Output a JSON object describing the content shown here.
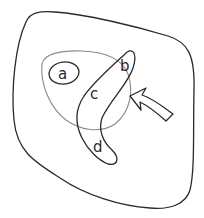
{
  "diagram": {
    "type": "venn-diagram",
    "universe": {
      "name": "universal-set-outline"
    },
    "sets": [
      {
        "name": "large-circle",
        "color": "#8a8a8a"
      },
      {
        "name": "set-a",
        "label": "a",
        "color": "#2a2a2a"
      },
      {
        "name": "boomerang-set",
        "color": "#2a2a2a"
      }
    ],
    "region_labels": {
      "a": "a",
      "b": "b",
      "c": "c",
      "d": "d"
    },
    "arrow": {
      "name": "curved-arrow",
      "points_to": "large-circle"
    },
    "colors": {
      "outline": "#2a2a2a",
      "circle_outline": "#8a8a8a",
      "background": "#ffffff"
    }
  }
}
